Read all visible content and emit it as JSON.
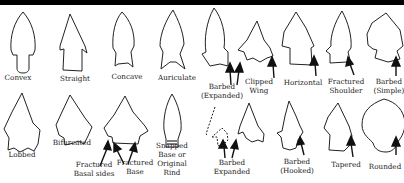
{
  "left_panel": {
    "row1": [
      {
        "label": "Convex"
      },
      {
        "label": "Straight"
      },
      {
        "label": "Concave"
      },
      {
        "label": "Auriculate"
      }
    ],
    "row2": [
      {
        "label": "Lobbed"
      },
      {
        "label": "Bifurcated"
      },
      {
        "label": "Fractured Basal sides",
        "lines": [
          "Fractured",
          "Basal sides"
        ]
      },
      {
        "label": "Fractured Base",
        "lines": [
          "Fractured",
          "Base"
        ]
      },
      {
        "label": "Snapped Base or Original Rind",
        "lines": [
          "Snapped",
          "Base or",
          "Original",
          "Rind"
        ]
      }
    ]
  },
  "right_panel": {
    "row1": [
      {
        "label": "Barbed (Expanded)",
        "lines": [
          "Barbed",
          "(Expanded)"
        ]
      },
      {
        "label": "Clipped Wing",
        "lines": [
          "Clipped",
          "Wing"
        ]
      },
      {
        "label": "Horizontal"
      },
      {
        "label": "Fractured Shoulder",
        "lines": [
          "Fractured",
          "Shoulder"
        ]
      },
      {
        "label": "Barbed (Simple)",
        "lines": [
          "Barbed",
          "(Simple)"
        ]
      }
    ],
    "row2": [
      {
        "label": "Barbed Expanded",
        "lines": [
          "Barbed",
          "Expanded"
        ]
      },
      {
        "label": "Barbed (Hooked)",
        "lines": [
          "Barbed",
          "(Hooked)"
        ]
      },
      {
        "label": "Tapered"
      },
      {
        "label": "Rounded"
      }
    ]
  }
}
